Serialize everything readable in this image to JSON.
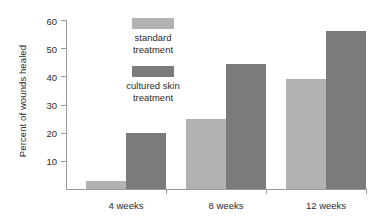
{
  "chart_data": {
    "type": "bar",
    "title": "",
    "xlabel": "",
    "ylabel": "Percent of wounds healed",
    "categories": [
      "4 weeks",
      "8 weeks",
      "12 weeks"
    ],
    "series": [
      {
        "name": "standard treatment",
        "color": "#b2b2b2",
        "values": [
          3,
          25,
          39
        ]
      },
      {
        "name": "cultured skin treatment",
        "color": "#7b7b7b",
        "values": [
          20,
          44.5,
          56
        ]
      }
    ],
    "ylim": [
      0,
      60
    ],
    "yticks": [
      10,
      20,
      30,
      40,
      50,
      60
    ],
    "ytick_labels": [
      "10",
      "20",
      "30",
      "40",
      "50",
      "60"
    ],
    "grid": false,
    "legend_position": "inside-top-left"
  },
  "legend": {
    "entries": [
      {
        "label_line1": "standard",
        "label_line2": "treatment",
        "color": "#b2b2b2"
      },
      {
        "label_line1": "cultured skin",
        "label_line2": "treatment",
        "color": "#7b7b7b"
      }
    ]
  },
  "axis": {
    "y_title": "Percent of wounds healed",
    "tick_labels": [
      "60",
      "50",
      "40",
      "30",
      "20",
      "10"
    ],
    "category_labels": [
      "4 weeks",
      "8 weeks",
      "12 weeks"
    ]
  }
}
